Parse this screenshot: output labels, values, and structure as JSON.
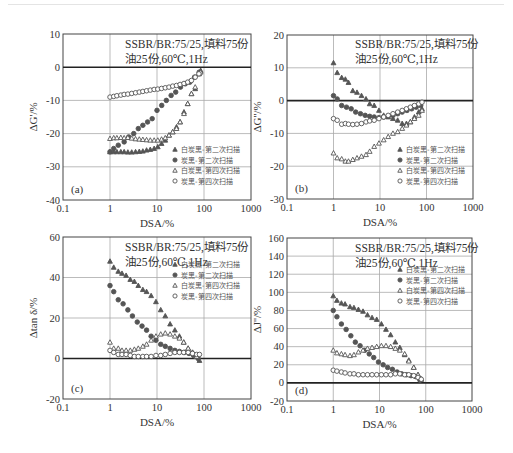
{
  "figure": {
    "annotation_line1": "SSBR/BR:75/25,填料75份",
    "annotation_line2": "油25份,60℃,1Hz",
    "legend": [
      {
        "label": "白炭黑-第二次扫描",
        "marker": "triangle-filled"
      },
      {
        "label": "炭黑-第二次扫描",
        "marker": "circle-filled"
      },
      {
        "label": "白炭黑-第四次扫描",
        "marker": "triangle-open"
      },
      {
        "label": "炭黑-第四次扫描",
        "marker": "circle-open"
      }
    ],
    "colors": {
      "marker": "#555555",
      "axis": "#444444",
      "grid": "#aaaaaa",
      "zero_line": "#222222"
    }
  },
  "chart_data": [
    {
      "type": "scatter",
      "panel": "(a)",
      "title": "",
      "xlabel": "DSA/%",
      "ylabel": "ΔG'/%",
      "xscale": "log",
      "xlim": [
        0.1,
        1000
      ],
      "ylim": [
        -40,
        10
      ],
      "xticks": [
        "0.1",
        "1",
        "10",
        "100",
        "1000"
      ],
      "yticks": [
        "10",
        "0",
        "-10",
        "-20",
        "-30",
        "-40"
      ],
      "ytick_values": [
        10,
        0,
        -10,
        -20,
        -30,
        -40
      ],
      "grid": true,
      "legend_position": "lower right",
      "pixel_box": {
        "x0": 63,
        "x1": 251,
        "y_top": 34,
        "y_bottom": 200
      },
      "legend_box": {
        "x": 175,
        "y": 152
      },
      "note_pos": {
        "x": 125,
        "y": 48
      },
      "series": [
        {
          "name": "白炭黑-第二次扫描",
          "marker": "triangle-filled",
          "x": [
            1,
            1.2,
            1.4,
            1.7,
            2,
            2.4,
            2.9,
            3.5,
            4.2,
            5,
            6,
            7.2,
            8.7,
            10.4,
            12.5,
            15,
            18,
            21.6,
            26,
            31,
            37.5,
            45,
            54,
            65,
            78,
            85
          ],
          "y": [
            -25.5,
            -25.5,
            -25.5,
            -25.5,
            -25.5,
            -25.6,
            -25.6,
            -25.5,
            -25.4,
            -25.3,
            -25,
            -24.8,
            -24.5,
            -24,
            -23,
            -22,
            -20.5,
            -19.5,
            -18,
            -16.5,
            -13.5,
            -11,
            -8,
            -6.5,
            -2,
            -1
          ]
        },
        {
          "name": "炭黑-第二次扫描",
          "marker": "circle-filled",
          "x": [
            1,
            1.2,
            1.5,
            2,
            2.5,
            3.2,
            4,
            5,
            6.3,
            7.9,
            10,
            12.6,
            15.8,
            20,
            25,
            31.6,
            40,
            50,
            63,
            79
          ],
          "y": [
            -25.5,
            -24.5,
            -23.5,
            -22.5,
            -21,
            -20,
            -18.5,
            -17.5,
            -16.5,
            -15.5,
            -13,
            -11.5,
            -10,
            -8.5,
            -7.5,
            -6,
            -5,
            -4.5,
            -3,
            -1.5
          ]
        },
        {
          "name": "白炭黑-第四次扫描",
          "marker": "triangle-open",
          "x": [
            1,
            1.2,
            1.4,
            1.7,
            2,
            2.4,
            2.9,
            3.5,
            4.2,
            5,
            6,
            7.2,
            8.7,
            10.4,
            12.5,
            15,
            18,
            21.6,
            26,
            31,
            37.5,
            45,
            54,
            65,
            78,
            85
          ],
          "y": [
            -21.5,
            -21.3,
            -21.3,
            -21.2,
            -21.3,
            -21.2,
            -21.4,
            -21.6,
            -21.7,
            -21.8,
            -21.9,
            -22,
            -22,
            -22,
            -21.7,
            -21.3,
            -20.5,
            -19.5,
            -18.5,
            -16.5,
            -14,
            -11,
            -8,
            -6,
            -2,
            -1.5
          ]
        },
        {
          "name": "炭黑-第四次扫描",
          "marker": "circle-open",
          "x": [
            1,
            1.2,
            1.4,
            1.7,
            2,
            2.4,
            2.9,
            3.5,
            4.2,
            5,
            6,
            7.2,
            8.7,
            10.4,
            12.5,
            15,
            18,
            21.6,
            26,
            31,
            37.5,
            45,
            54,
            65,
            78
          ],
          "y": [
            -9,
            -8.8,
            -8.6,
            -8.4,
            -8.2,
            -8.1,
            -7.9,
            -7.7,
            -7.5,
            -7.3,
            -7.1,
            -6.9,
            -6.7,
            -6.6,
            -6.4,
            -6.2,
            -6,
            -5.7,
            -5.5,
            -5.2,
            -4.9,
            -4.5,
            -4,
            -3,
            -2
          ]
        }
      ]
    },
    {
      "type": "scatter",
      "panel": "(b)",
      "title": "",
      "xlabel": "DSA/%",
      "ylabel": "ΔG''/%",
      "xscale": "log",
      "xlim": [
        0.1,
        1000
      ],
      "ylim": [
        -30,
        20
      ],
      "xticks": [
        "0.1",
        "1",
        "10",
        "100",
        "1000"
      ],
      "yticks": [
        "20",
        "10",
        "0",
        "-10",
        "-20",
        "-30"
      ],
      "ytick_values": [
        20,
        10,
        0,
        -10,
        -20,
        -30
      ],
      "grid": true,
      "legend_position": "lower right",
      "pixel_box": {
        "x0": 287,
        "x1": 473,
        "y_top": 35,
        "y_bottom": 199
      },
      "legend_box": {
        "x": 400,
        "y": 152
      },
      "note_pos": {
        "x": 355,
        "y": 48
      },
      "series": [
        {
          "name": "白炭黑-第二次扫描",
          "marker": "triangle-filled",
          "x": [
            1,
            1.2,
            1.5,
            1.8,
            2.1,
            2.6,
            3.2,
            4,
            5,
            6,
            7.5,
            9.5,
            12,
            15,
            19,
            24,
            30,
            37,
            45,
            55,
            68,
            80
          ],
          "y": [
            11.5,
            8.5,
            7,
            6.5,
            5.5,
            3,
            2.5,
            1.5,
            0.5,
            -1,
            -1.5,
            -3,
            -4.5,
            -5,
            -5.5,
            -6,
            -7,
            -7,
            -6.5,
            -5,
            -3.5,
            -2.5
          ]
        },
        {
          "name": "炭黑-第二次扫描",
          "marker": "circle-filled",
          "x": [
            1,
            1.2,
            1.5,
            1.9,
            2.4,
            3,
            3.8,
            4.8,
            6,
            7.5,
            9.5,
            12,
            15,
            19,
            24,
            30,
            38,
            48,
            60,
            75
          ],
          "y": [
            1.5,
            0.5,
            -1.5,
            -2,
            -2.5,
            -3.5,
            -4,
            -4.5,
            -4.8,
            -5,
            -5.2,
            -5,
            -4.8,
            -4.5,
            -4,
            -3.5,
            -3,
            -2.5,
            -2,
            -1.5
          ]
        },
        {
          "name": "白炭黑-第四次扫描",
          "marker": "triangle-open",
          "x": [
            1,
            1.2,
            1.5,
            1.8,
            2.1,
            2.6,
            3.2,
            4,
            5,
            6,
            7.5,
            9.5,
            12,
            15,
            19,
            24,
            30,
            37,
            45,
            55,
            68,
            80
          ],
          "y": [
            -16,
            -17.5,
            -17.8,
            -18.5,
            -18.5,
            -18,
            -17.5,
            -17,
            -16.5,
            -15.5,
            -14,
            -13,
            -12,
            -11,
            -10,
            -9.5,
            -8.5,
            -7.5,
            -6.5,
            -5.5,
            -4.5,
            -3
          ]
        },
        {
          "name": "炭黑-第四次扫描",
          "marker": "circle-open",
          "x": [
            1,
            1.2,
            1.5,
            1.8,
            2.1,
            2.6,
            3.2,
            4,
            5,
            6,
            7.5,
            9.5,
            12,
            15,
            19,
            24,
            30,
            37,
            45,
            55,
            68,
            80
          ],
          "y": [
            -5.5,
            -6,
            -7.2,
            -7,
            -7.2,
            -7.3,
            -7.2,
            -7,
            -6.5,
            -6.2,
            -6,
            -5.5,
            -5,
            -4.5,
            -4,
            -3.5,
            -3,
            -2.5,
            -2,
            -1.5,
            -1,
            -0.5
          ]
        }
      ]
    },
    {
      "type": "scatter",
      "panel": "(c)",
      "title": "",
      "xlabel": "DSA/%",
      "ylabel": "Δtan δ/%",
      "xscale": "log",
      "xlim": [
        0.1,
        1000
      ],
      "ylim": [
        -20,
        60
      ],
      "xticks": [
        "0.1",
        "1",
        "10",
        "100",
        "1000"
      ],
      "yticks": [
        "60",
        "40",
        "20",
        "0",
        "-20"
      ],
      "ytick_values": [
        60,
        40,
        20,
        0,
        -20
      ],
      "grid": true,
      "legend_position": "upper right",
      "pixel_box": {
        "x0": 63,
        "x1": 251,
        "y_top": 237,
        "y_bottom": 399
      },
      "legend_box": {
        "x": 175,
        "y": 267
      },
      "note_pos": {
        "x": 125,
        "y": 251
      },
      "series": [
        {
          "name": "白炭黑-第二次扫描",
          "marker": "triangle-filled",
          "x": [
            1,
            1.2,
            1.5,
            1.8,
            2.2,
            2.7,
            3.3,
            4,
            5,
            6,
            7.5,
            9.5,
            12,
            15,
            19,
            24,
            30,
            37,
            46,
            57,
            70,
            80
          ],
          "y": [
            48,
            45,
            43,
            42,
            41,
            39,
            38,
            36,
            34,
            33,
            31,
            28,
            24,
            21,
            17,
            14,
            11,
            8,
            5,
            3,
            1,
            -1
          ]
        },
        {
          "name": "炭黑-第二次扫描",
          "marker": "circle-filled",
          "x": [
            1,
            1.2,
            1.5,
            1.9,
            2.4,
            3,
            3.8,
            4.8,
            6,
            7.5,
            9.5,
            12,
            15,
            19,
            24,
            30,
            38,
            48,
            60,
            75
          ],
          "y": [
            36,
            33,
            29,
            27,
            24,
            21,
            18,
            16,
            14,
            11,
            9,
            7,
            6,
            5,
            4,
            3.5,
            3,
            2.5,
            1.5,
            0
          ]
        },
        {
          "name": "白炭黑-第四次扫描",
          "marker": "triangle-open",
          "x": [
            1,
            1.2,
            1.5,
            1.8,
            2.2,
            2.7,
            3.3,
            4,
            5,
            6,
            7.5,
            9.5,
            12,
            15,
            19,
            24,
            30,
            37,
            46,
            57,
            70
          ],
          "y": [
            8,
            5,
            5,
            4,
            4,
            4,
            4.5,
            5,
            6,
            7,
            9,
            11,
            12,
            12.5,
            12,
            11,
            10,
            8,
            5,
            3,
            1
          ]
        },
        {
          "name": "炭黑-第四次扫描",
          "marker": "circle-open",
          "x": [
            1,
            1.2,
            1.5,
            1.8,
            2.2,
            2.7,
            3.3,
            4,
            5,
            6,
            7.5,
            9.5,
            12,
            15,
            19,
            24,
            30,
            37,
            46,
            57,
            70,
            80
          ],
          "y": [
            4,
            3,
            2,
            2,
            2,
            1.5,
            1,
            1,
            1,
            1,
            1,
            1.5,
            1.5,
            2,
            2.5,
            3,
            3,
            3,
            3,
            2.5,
            2,
            2
          ]
        }
      ]
    },
    {
      "type": "scatter",
      "panel": "(d)",
      "title": "",
      "xlabel": "DSA/%",
      "ylabel": "ΔJ''/%",
      "xscale": "log",
      "xlim": [
        0.1,
        1000
      ],
      "ylim": [
        -20,
        160
      ],
      "xticks": [
        "0.1",
        "1",
        "10",
        "100",
        "1000"
      ],
      "yticks": [
        "160",
        "140",
        "120",
        "100",
        "80",
        "60",
        "40",
        "20",
        "0",
        "-20"
      ],
      "ytick_values": [
        160,
        140,
        120,
        100,
        80,
        60,
        40,
        20,
        0,
        -20
      ],
      "grid": true,
      "legend_position": "upper right",
      "pixel_box": {
        "x0": 287,
        "x1": 472,
        "y_top": 238,
        "y_bottom": 401
      },
      "legend_box": {
        "x": 400,
        "y": 272
      },
      "note_pos": {
        "x": 355,
        "y": 252
      },
      "series": [
        {
          "name": "白炭黑-第二次扫描",
          "marker": "triangle-filled",
          "x": [
            1,
            1.2,
            1.5,
            1.8,
            2.3,
            2.8,
            3.5,
            4.4,
            5.5,
            6.9,
            8.7,
            11,
            13.8,
            17.4,
            22,
            27.5,
            35,
            43,
            55,
            68,
            80
          ],
          "y": [
            96,
            91,
            88,
            87,
            84,
            83,
            81,
            79,
            75,
            72,
            70,
            65,
            59,
            53,
            45,
            39,
            31,
            25,
            17,
            9,
            4
          ]
        },
        {
          "name": "炭黑-第二次扫描",
          "marker": "circle-filled",
          "x": [
            1,
            1.2,
            1.5,
            1.9,
            2.4,
            3,
            3.8,
            4.8,
            6,
            7.5,
            9.5,
            12,
            15,
            19,
            24,
            30,
            38,
            48,
            60,
            75
          ],
          "y": [
            80,
            73,
            65,
            59,
            52,
            45,
            41,
            36,
            32,
            28,
            23,
            20,
            17,
            15,
            12,
            10,
            9,
            8,
            7,
            3
          ]
        },
        {
          "name": "白炭黑-第四次扫描",
          "marker": "triangle-open",
          "x": [
            1,
            1.2,
            1.5,
            1.8,
            2.3,
            2.8,
            3.5,
            4.4,
            5.5,
            6.9,
            8.7,
            11,
            13.8,
            17.4,
            22,
            27.5,
            35,
            43,
            55,
            68,
            80
          ],
          "y": [
            36,
            33,
            32,
            31,
            30,
            31,
            34,
            36,
            38,
            39,
            40,
            41,
            41,
            40,
            38,
            36,
            32,
            24,
            17,
            9,
            4
          ]
        },
        {
          "name": "炭黑-第四次扫描",
          "marker": "circle-open",
          "x": [
            1,
            1.2,
            1.5,
            1.8,
            2.3,
            2.8,
            3.5,
            4.4,
            5.5,
            6.9,
            8.7,
            11,
            13.8,
            17.4,
            22,
            27.5,
            35,
            43,
            55,
            68,
            80
          ],
          "y": [
            14,
            13,
            12,
            11,
            10,
            10,
            9,
            9,
            9,
            9,
            9,
            9,
            9,
            9,
            10,
            10,
            9,
            9,
            8,
            6,
            4
          ]
        }
      ]
    }
  ]
}
